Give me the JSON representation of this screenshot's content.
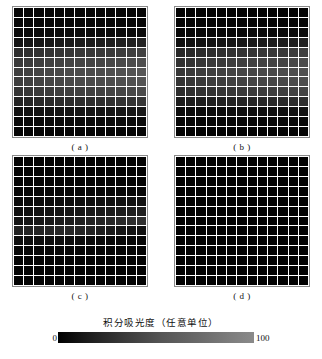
{
  "figure": {
    "panels": [
      {
        "id": "a",
        "label": "( a )",
        "rows": 13,
        "cols": 13
      },
      {
        "id": "b",
        "label": "( b )",
        "rows": 13,
        "cols": 13
      },
      {
        "id": "c",
        "label": "( c )",
        "rows": 13,
        "cols": 13
      },
      {
        "id": "d",
        "label": "( d )",
        "rows": 13,
        "cols": 13
      }
    ]
  },
  "legend": {
    "title": "积分吸光度（任意单位）",
    "min_label": "0",
    "max_label": "100",
    "gradient_start": "#000000",
    "gradient_end": "#8a8a8a"
  },
  "chart_data": {
    "type": "heatmap",
    "title": "积分吸光度（任意单位）",
    "xlabel": "",
    "ylabel": "",
    "grid": false,
    "legend_position": "bottom",
    "colormap": "grayscale",
    "zlim": [
      0,
      100
    ],
    "colorbar_ticks": [
      "0",
      "100"
    ],
    "panels": [
      {
        "name": "( a )",
        "rows": 13,
        "cols": 13,
        "values": [
          [
            4,
            4,
            4,
            4,
            4,
            4,
            4,
            4,
            4,
            4,
            4,
            4,
            4
          ],
          [
            5,
            5,
            5,
            5,
            5,
            5,
            5,
            5,
            5,
            5,
            5,
            5,
            5
          ],
          [
            7,
            7,
            8,
            8,
            8,
            8,
            8,
            8,
            8,
            8,
            8,
            8,
            9
          ],
          [
            14,
            15,
            16,
            17,
            18,
            19,
            20,
            20,
            21,
            22,
            23,
            24,
            26
          ],
          [
            33,
            35,
            36,
            38,
            39,
            40,
            41,
            41,
            42,
            43,
            44,
            46,
            48
          ],
          [
            41,
            43,
            45,
            47,
            48,
            49,
            50,
            50,
            51,
            52,
            53,
            55,
            57
          ],
          [
            45,
            47,
            49,
            51,
            52,
            54,
            55,
            55,
            56,
            57,
            58,
            60,
            62
          ],
          [
            44,
            46,
            48,
            50,
            51,
            53,
            54,
            54,
            55,
            56,
            57,
            59,
            61
          ],
          [
            38,
            40,
            42,
            43,
            45,
            46,
            47,
            47,
            48,
            49,
            50,
            52,
            54
          ],
          [
            26,
            27,
            29,
            30,
            31,
            32,
            33,
            33,
            34,
            35,
            36,
            37,
            39
          ],
          [
            12,
            12,
            13,
            13,
            14,
            14,
            15,
            15,
            15,
            16,
            16,
            17,
            18
          ],
          [
            6,
            6,
            6,
            7,
            7,
            7,
            7,
            7,
            7,
            8,
            8,
            8,
            8
          ],
          [
            4,
            4,
            4,
            4,
            4,
            4,
            4,
            4,
            4,
            4,
            4,
            4,
            5
          ]
        ]
      },
      {
        "name": "( b )",
        "rows": 13,
        "cols": 13,
        "values": [
          [
            3,
            3,
            3,
            3,
            3,
            3,
            3,
            3,
            3,
            3,
            3,
            3,
            3
          ],
          [
            4,
            4,
            4,
            4,
            4,
            4,
            4,
            4,
            4,
            4,
            4,
            4,
            4
          ],
          [
            6,
            6,
            6,
            6,
            6,
            6,
            6,
            7,
            7,
            7,
            7,
            7,
            8
          ],
          [
            11,
            12,
            13,
            14,
            15,
            16,
            17,
            18,
            19,
            20,
            21,
            22,
            24
          ],
          [
            28,
            30,
            32,
            33,
            35,
            36,
            37,
            38,
            39,
            40,
            41,
            43,
            45
          ],
          [
            36,
            38,
            40,
            42,
            43,
            45,
            46,
            47,
            48,
            49,
            50,
            52,
            54
          ],
          [
            40,
            42,
            44,
            46,
            47,
            49,
            50,
            51,
            52,
            53,
            54,
            56,
            58
          ],
          [
            38,
            40,
            42,
            44,
            45,
            47,
            48,
            49,
            50,
            51,
            52,
            54,
            56
          ],
          [
            32,
            34,
            36,
            37,
            39,
            40,
            41,
            42,
            43,
            44,
            45,
            47,
            49
          ],
          [
            20,
            21,
            22,
            23,
            24,
            25,
            26,
            27,
            28,
            29,
            30,
            31,
            33
          ],
          [
            8,
            8,
            9,
            9,
            9,
            10,
            10,
            10,
            11,
            11,
            11,
            12,
            13
          ],
          [
            4,
            4,
            4,
            5,
            5,
            5,
            5,
            5,
            5,
            6,
            6,
            6,
            6
          ],
          [
            3,
            3,
            3,
            3,
            3,
            3,
            3,
            3,
            3,
            3,
            3,
            3,
            4
          ]
        ]
      },
      {
        "name": "( c )",
        "rows": 13,
        "cols": 13,
        "values": [
          [
            2,
            2,
            2,
            2,
            2,
            2,
            2,
            2,
            2,
            2,
            2,
            2,
            2
          ],
          [
            2,
            2,
            2,
            2,
            2,
            2,
            2,
            2,
            2,
            2,
            2,
            2,
            2
          ],
          [
            3,
            3,
            3,
            3,
            3,
            3,
            3,
            3,
            3,
            3,
            3,
            3,
            3
          ],
          [
            4,
            4,
            4,
            4,
            4,
            4,
            5,
            5,
            5,
            5,
            5,
            5,
            6
          ],
          [
            7,
            7,
            8,
            8,
            9,
            9,
            10,
            11,
            12,
            12,
            13,
            13,
            14
          ],
          [
            10,
            11,
            12,
            13,
            14,
            15,
            16,
            18,
            19,
            20,
            21,
            22,
            23
          ],
          [
            14,
            15,
            17,
            18,
            20,
            21,
            23,
            25,
            27,
            29,
            31,
            33,
            35
          ],
          [
            24,
            25,
            26,
            27,
            28,
            28,
            27,
            25,
            22,
            19,
            16,
            14,
            12
          ],
          [
            10,
            10,
            10,
            10,
            10,
            9,
            9,
            8,
            7,
            6,
            6,
            5,
            5
          ],
          [
            5,
            5,
            5,
            5,
            5,
            4,
            4,
            4,
            4,
            4,
            4,
            4,
            3
          ],
          [
            3,
            3,
            3,
            3,
            3,
            3,
            3,
            3,
            3,
            3,
            3,
            3,
            3
          ],
          [
            2,
            2,
            2,
            2,
            2,
            2,
            2,
            2,
            2,
            2,
            2,
            2,
            2
          ],
          [
            2,
            2,
            2,
            2,
            2,
            2,
            2,
            2,
            2,
            2,
            2,
            2,
            2
          ]
        ]
      },
      {
        "name": "( d )",
        "rows": 13,
        "cols": 13,
        "values": [
          [
            1,
            1,
            1,
            1,
            1,
            1,
            1,
            1,
            1,
            1,
            1,
            1,
            1
          ],
          [
            1,
            1,
            1,
            1,
            1,
            1,
            1,
            1,
            1,
            1,
            1,
            1,
            1
          ],
          [
            1,
            1,
            1,
            1,
            1,
            1,
            1,
            1,
            1,
            1,
            1,
            1,
            1
          ],
          [
            1,
            1,
            1,
            1,
            1,
            1,
            1,
            1,
            1,
            1,
            1,
            1,
            1
          ],
          [
            1,
            1,
            1,
            1,
            1,
            1,
            1,
            1,
            1,
            1,
            1,
            1,
            1
          ],
          [
            1,
            1,
            1,
            1,
            1,
            1,
            1,
            1,
            1,
            1,
            1,
            1,
            1
          ],
          [
            1,
            1,
            1,
            1,
            1,
            1,
            1,
            1,
            1,
            1,
            1,
            1,
            1
          ],
          [
            1,
            1,
            1,
            1,
            1,
            1,
            1,
            1,
            1,
            1,
            1,
            1,
            1
          ],
          [
            1,
            1,
            1,
            1,
            1,
            1,
            1,
            1,
            1,
            1,
            1,
            1,
            1
          ],
          [
            1,
            1,
            1,
            1,
            1,
            1,
            1,
            1,
            1,
            1,
            1,
            1,
            1
          ],
          [
            1,
            1,
            1,
            1,
            1,
            1,
            1,
            1,
            1,
            1,
            1,
            1,
            1
          ],
          [
            1,
            1,
            1,
            1,
            1,
            1,
            1,
            1,
            1,
            1,
            1,
            1,
            1
          ],
          [
            1,
            1,
            1,
            1,
            1,
            1,
            1,
            1,
            1,
            1,
            1,
            1,
            1
          ]
        ]
      }
    ]
  }
}
